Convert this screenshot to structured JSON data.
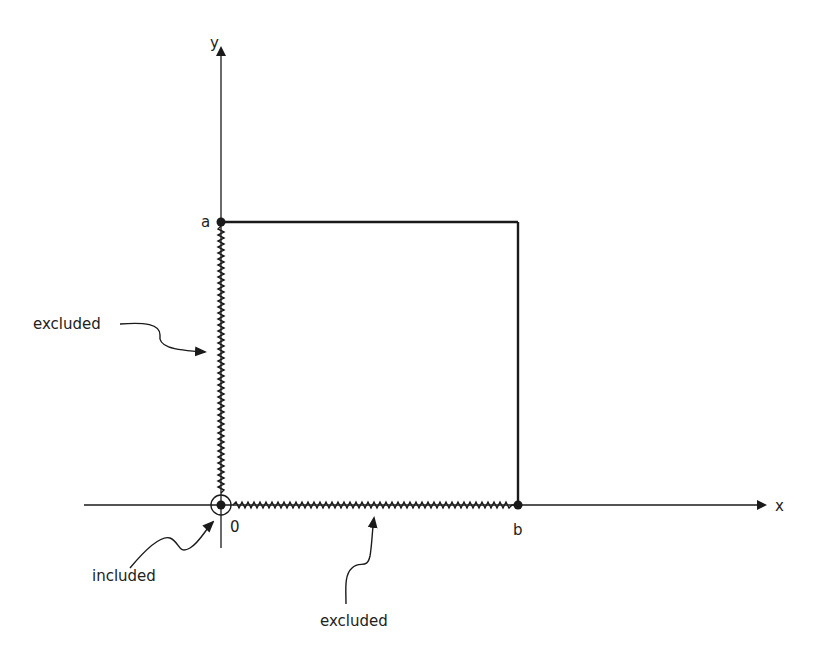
{
  "diagram": {
    "axes": {
      "x_label": "x",
      "y_label": "y",
      "origin_label": "0"
    },
    "points": {
      "a_label": "a",
      "b_label": "b"
    },
    "annotations": {
      "left_edge_label": "excluded",
      "bottom_edge_label": "excluded",
      "origin_label": "included"
    },
    "colors": {
      "ink": "#1a1a1a",
      "background": "#ffffff"
    }
  }
}
